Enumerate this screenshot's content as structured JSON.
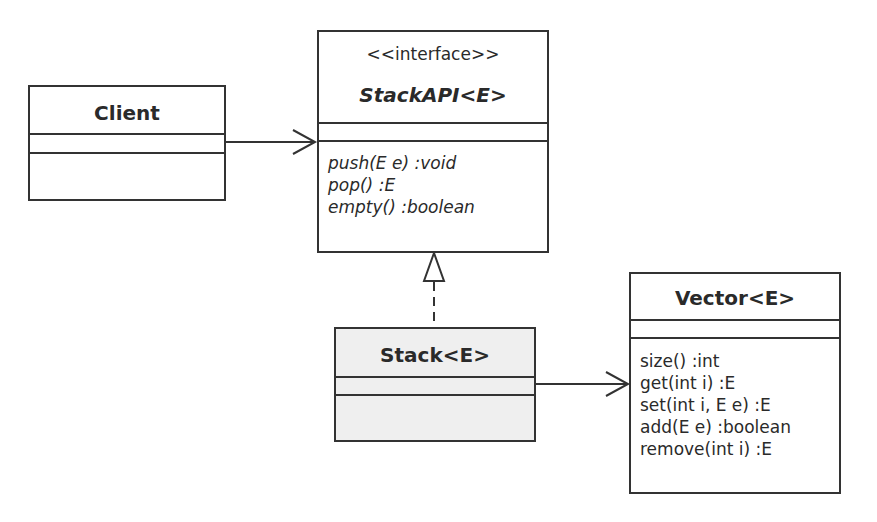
{
  "diagram": {
    "type": "uml-class-diagram",
    "classes": [
      {
        "id": "client",
        "name": "Client",
        "stereotype": null,
        "abstract": false,
        "attributes": [],
        "operations": []
      },
      {
        "id": "stackapi",
        "name": "StackAPI<E>",
        "stereotype": "<<interface>>",
        "abstract": true,
        "attributes": [],
        "operations": [
          "push(E e) :void",
          "pop() :E",
          "empty() :boolean"
        ]
      },
      {
        "id": "stack",
        "name": "Stack<E>",
        "stereotype": null,
        "abstract": false,
        "attributes": [],
        "operations": []
      },
      {
        "id": "vector",
        "name": "Vector<E>",
        "stereotype": null,
        "abstract": false,
        "attributes": [],
        "operations": [
          "size() :int",
          "get(int i) :E",
          "set(int i, E e) :E",
          "add(E e) :boolean",
          "remove(int i) :E"
        ]
      }
    ],
    "relationships": [
      {
        "from": "Client",
        "to": "StackAPI<E>",
        "kind": "association",
        "arrow": "open"
      },
      {
        "from": "Stack<E>",
        "to": "StackAPI<E>",
        "kind": "realization",
        "arrow": "hollow-triangle",
        "line": "dashed"
      },
      {
        "from": "Stack<E>",
        "to": "Vector<E>",
        "kind": "association",
        "arrow": "open"
      }
    ]
  }
}
